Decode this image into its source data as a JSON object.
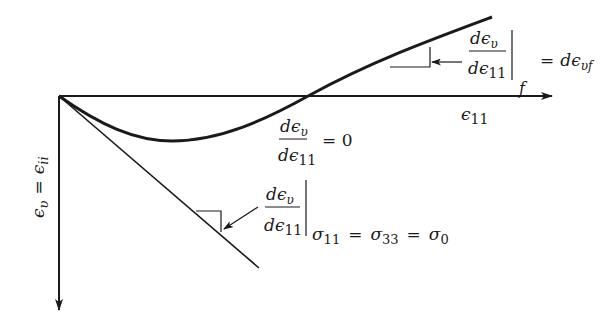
{
  "diagram": {
    "axes": {
      "x_label": "ϵ",
      "x_label_sub": "11",
      "y_label_lhs": "ϵ",
      "y_label_lhs_sub": "υ",
      "y_label_eq": "=",
      "y_label_rhs": "ϵ",
      "y_label_rhs_sub": "ii"
    },
    "annotations": {
      "final_slope": {
        "num": "dϵ",
        "num_sub": "υ",
        "den": "dϵ",
        "den_sub": "11",
        "eval_sub": "f",
        "eq": "=",
        "rhs": "dϵ",
        "rhs_sub": "υf"
      },
      "zero_slope": {
        "num": "dϵ",
        "num_sub": "υ",
        "den": "dϵ",
        "den_sub": "11",
        "eq": "= 0"
      },
      "initial_slope": {
        "num": "dϵ",
        "num_sub": "υ",
        "den": "dϵ",
        "den_sub": "11",
        "cond_a": "σ",
        "cond_a_sub": "11",
        "cond_eq1": "=",
        "cond_b": "σ",
        "cond_b_sub": "33",
        "cond_eq2": "=",
        "cond_c": "σ",
        "cond_c_sub": "0"
      }
    },
    "colors": {
      "ink": "#1a1a1a",
      "background": "#ffffff"
    }
  }
}
